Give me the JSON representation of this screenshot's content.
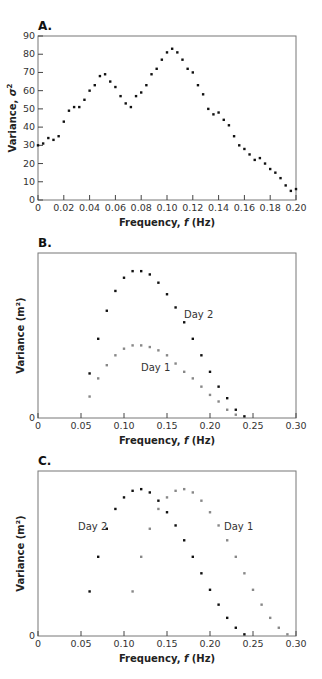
{
  "chart_data": [
    {
      "panel": "A.",
      "type": "scatter",
      "title": "",
      "xlabel": "Frequency, f (Hz)",
      "ylabel": "Variance, σ²",
      "xlim": [
        0,
        0.2
      ],
      "ylim": [
        0,
        90
      ],
      "xticks": [
        "0",
        "0.02",
        "0.04",
        "0.06",
        "0.08",
        "0.10",
        "0.12",
        "0.14",
        "0.16",
        "0.18",
        "0.20"
      ],
      "yticks": [
        "0",
        "10",
        "20",
        "30",
        "40",
        "50",
        "60",
        "70",
        "80",
        "90"
      ],
      "grid": false,
      "series": [
        {
          "name": "spectrum",
          "color": "#111111",
          "x": [
            0.0,
            0.004,
            0.008,
            0.012,
            0.016,
            0.02,
            0.024,
            0.028,
            0.032,
            0.036,
            0.04,
            0.044,
            0.048,
            0.052,
            0.056,
            0.06,
            0.064,
            0.068,
            0.072,
            0.076,
            0.08,
            0.084,
            0.088,
            0.092,
            0.096,
            0.1,
            0.104,
            0.108,
            0.112,
            0.116,
            0.12,
            0.124,
            0.128,
            0.132,
            0.136,
            0.14,
            0.144,
            0.148,
            0.152,
            0.156,
            0.16,
            0.164,
            0.168,
            0.172,
            0.176,
            0.18,
            0.184,
            0.188,
            0.192,
            0.196,
            0.2
          ],
          "y": [
            30,
            31,
            34,
            33,
            35,
            43,
            49,
            51,
            51,
            55,
            60,
            63,
            68,
            69,
            65,
            62,
            57,
            53,
            51,
            57,
            59,
            63,
            69,
            72,
            77,
            81,
            83,
            81,
            77,
            72,
            70,
            63,
            58,
            50,
            47,
            48,
            44,
            41,
            35,
            30,
            28,
            25,
            22,
            23,
            20,
            17,
            15,
            12,
            8,
            5,
            6
          ]
        }
      ]
    },
    {
      "panel": "B.",
      "type": "scatter",
      "title": "",
      "xlabel": "Frequency, f (Hz)",
      "ylabel": "Variance (m²)",
      "xlim": [
        0,
        0.3
      ],
      "ylim": [
        0,
        100
      ],
      "y_units_note": "y axis unlabeled except 0; values in relative units",
      "xticks": [
        "0",
        "0.05",
        "0.10",
        "0.15",
        "0.20",
        "0.25",
        "0.30"
      ],
      "yticks": [
        "0"
      ],
      "grid": false,
      "annotations": [
        {
          "text": "Day 2",
          "x": 0.175,
          "y": 90
        },
        {
          "text": "Day 1",
          "x": 0.135,
          "y": 90
        }
      ],
      "series": [
        {
          "name": "Day 2",
          "color": "#111111",
          "x": [
            0.06,
            0.07,
            0.08,
            0.09,
            0.1,
            0.11,
            0.12,
            0.13,
            0.14,
            0.15,
            0.16,
            0.17,
            0.18,
            0.19,
            0.2,
            0.21,
            0.22,
            0.23,
            0.24
          ],
          "y": [
            27,
            48,
            65,
            77,
            85,
            89,
            89,
            87,
            82,
            75,
            67,
            58,
            48,
            38,
            28,
            19,
            12,
            5,
            1
          ]
        },
        {
          "name": "Day 1",
          "color": "#888888",
          "x": [
            0.06,
            0.07,
            0.08,
            0.09,
            0.1,
            0.11,
            0.12,
            0.13,
            0.14,
            0.15,
            0.16,
            0.17,
            0.18,
            0.19,
            0.2,
            0.21,
            0.22,
            0.23
          ],
          "y": [
            13,
            24,
            32,
            38,
            42,
            44,
            44,
            43,
            41,
            38,
            33,
            28,
            24,
            19,
            14,
            10,
            5,
            2
          ]
        }
      ]
    },
    {
      "panel": "C.",
      "type": "scatter",
      "title": "",
      "xlabel": "Frequency, f (Hz)",
      "ylabel": "Variance (m²)",
      "xlim": [
        0,
        0.3
      ],
      "ylim": [
        0,
        100
      ],
      "y_units_note": "y axis unlabeled except 0; values in relative units",
      "xticks": [
        "0",
        "0.05",
        "0.10",
        "0.15",
        "0.20",
        "0.25",
        "0.30"
      ],
      "yticks": [
        "0"
      ],
      "grid": false,
      "annotations": [
        {
          "text": "Day 2",
          "x": 0.045,
          "y": 65
        },
        {
          "text": "Day 1",
          "x": 0.215,
          "y": 65
        }
      ],
      "series": [
        {
          "name": "Day 2",
          "color": "#111111",
          "x": [
            0.06,
            0.07,
            0.08,
            0.09,
            0.1,
            0.11,
            0.12,
            0.13,
            0.14,
            0.15,
            0.16,
            0.17,
            0.18,
            0.19,
            0.2,
            0.21,
            0.22,
            0.23,
            0.24
          ],
          "y": [
            27,
            48,
            65,
            77,
            84,
            88,
            89,
            87,
            82,
            75,
            67,
            58,
            48,
            38,
            28,
            19,
            11,
            5,
            1
          ]
        },
        {
          "name": "Day 1",
          "color": "#888888",
          "x": [
            0.11,
            0.12,
            0.13,
            0.14,
            0.15,
            0.16,
            0.17,
            0.18,
            0.19,
            0.2,
            0.21,
            0.22,
            0.23,
            0.24,
            0.25,
            0.26,
            0.27,
            0.28,
            0.29
          ],
          "y": [
            27,
            48,
            65,
            77,
            84,
            88,
            89,
            87,
            82,
            75,
            67,
            58,
            48,
            38,
            28,
            19,
            11,
            5,
            1
          ]
        }
      ]
    }
  ],
  "panels": {
    "a": {
      "label": "A.",
      "xlabel_prefix": "Frequency, ",
      "xlabel_var": "f",
      "xlabel_unit": " (Hz)",
      "ylabel_prefix": "Variance, ",
      "ylabel_var": "σ",
      "ylabel_sup": "2"
    },
    "b": {
      "label": "B.",
      "xlabel_prefix": "Frequency, ",
      "xlabel_var": "f",
      "xlabel_unit": " (Hz)",
      "ylabel": "Variance (m²)",
      "day2": "Day 2",
      "day1": "Day 1"
    },
    "c": {
      "label": "C.",
      "xlabel_prefix": "Frequency, ",
      "xlabel_var": "f",
      "xlabel_unit": " (Hz)",
      "ylabel": "Variance (m²)",
      "day2": "Day 2",
      "day1": "Day 1"
    }
  }
}
